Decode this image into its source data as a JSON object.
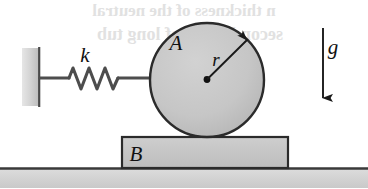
{
  "figure": {
    "caption": "Disk A connected by spring k to a wall, resting on block B on the ground, with gravity g acting downward"
  },
  "labels": {
    "spring_constant": "k",
    "disk": "A",
    "radius": "r",
    "block": "B",
    "gravity": "g"
  },
  "colors": {
    "body_fill": "#c6c6c6",
    "block_fill": "#c4c4c4",
    "wall_fill": "#cfcfcf",
    "outline": "#2b2b2b",
    "ground_fill": "#d2d2d2",
    "ink": "#111111",
    "bleed": "#c9c9c9",
    "background": "#ffffff"
  },
  "geometry": {
    "canvas_width": 368,
    "canvas_height": 188,
    "wall": {
      "x": 22,
      "y": 48,
      "width": 18,
      "height": 58
    },
    "spring_rod": {
      "x1": 40,
      "y1": 78,
      "x2": 207,
      "y2": 78
    },
    "spring_coils": {
      "start_x": 68,
      "end_x": 118,
      "amplitude": 11,
      "turns": 6
    },
    "disk": {
      "cx": 207,
      "cy": 80,
      "r": 57
    },
    "radius_arrow": {
      "x1": 207,
      "y1": 80,
      "x2": 250,
      "y2": 37
    },
    "block": {
      "x": 122,
      "y": 137,
      "width": 166,
      "height": 31
    },
    "ground_line": {
      "y": 168
    },
    "gravity_arrow": {
      "x": 323,
      "y1": 28,
      "y2": 103
    }
  },
  "label_positions": {
    "spring_constant": {
      "x": 85,
      "y": 62
    },
    "disk": {
      "x": 176,
      "y": 50
    },
    "radius": {
      "x": 216,
      "y": 66
    },
    "block": {
      "x": 136,
      "y": 161
    },
    "gravity": {
      "x": 333,
      "y": 54
    }
  },
  "bleed_through": {
    "line1": "n thickness of the neutral",
    "line2": "second block of long tub"
  }
}
